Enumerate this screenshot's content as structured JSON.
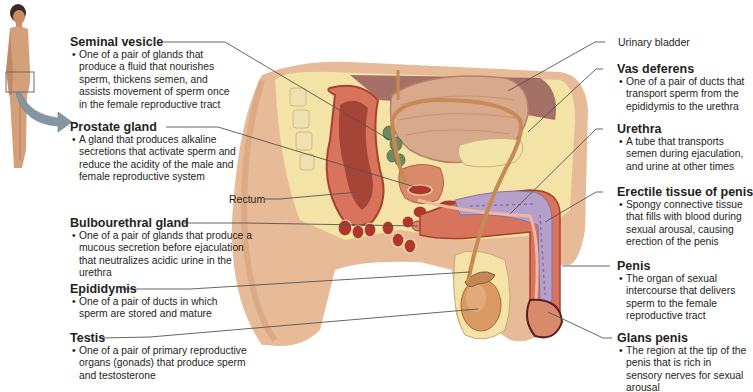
{
  "figure": {
    "locator_icon": "human-figure-with-pelvis-box",
    "arrow_color": "#8596a3",
    "colors": {
      "skin": "#e4b48f",
      "skin_shadow": "#c98e66",
      "fat": "#f4e3a6",
      "muscle": "#d9735a",
      "muscle_dark": "#b1372c",
      "bladder": "#d9a98d",
      "seminal_vesicle": "#6f8a5e",
      "erectile": "#b5a0c9",
      "vas_deferens": "#c78a55",
      "testis": "#d99a63",
      "leader_line": "#555555"
    }
  },
  "labels_left": [
    {
      "id": "seminal-vesicle",
      "title": "Seminal vesicle",
      "desc": "One of a pair of glands that produce a fluid that nourishes sperm, thickens semen, and assists movement of sperm once in the female reproductive tract"
    },
    {
      "id": "prostate-gland",
      "title": "Prostate gland",
      "desc": "A gland that produces alkaline secretions that activate sperm and reduce the acidity of the male and female reproductive system"
    },
    {
      "id": "bulbourethral-gland",
      "title": "Bulbourethral gland",
      "desc": "One of a pair of glands that produce a mucous secretion before ejaculation that neutralizes acidic urine in the urethra"
    },
    {
      "id": "epididymis",
      "title": "Epididymis",
      "desc": "One of a pair of ducts in which sperm are stored and mature"
    },
    {
      "id": "testis",
      "title": "Testis",
      "desc": "One of a pair of primary reproductive organs (gonads) that produce sperm and testosterone"
    }
  ],
  "labels_right": [
    {
      "id": "vas-deferens",
      "title": "Vas deferens",
      "desc": "One of a pair of ducts that transport sperm from the epididymis to the urethra"
    },
    {
      "id": "urethra",
      "title": "Urethra",
      "desc": "A tube that transports semen during ejaculation, and urine at other times"
    },
    {
      "id": "erectile-tissue",
      "title": "Erectile tissue of penis",
      "desc": "Spongy connective tissue that fills with blood during sexual arousal, causing erection of the penis"
    },
    {
      "id": "penis",
      "title": "Penis",
      "desc": "The organ of sexual intercourse that delivers sperm to the female reproductive tract"
    },
    {
      "id": "glans-penis",
      "title": "Glans penis",
      "desc": "The region at the tip of the penis that is rich in sensory nerves for sexual arousal"
    }
  ],
  "plain_labels": {
    "rectum": "Rectum",
    "urinary_bladder": "Urinary bladder"
  }
}
